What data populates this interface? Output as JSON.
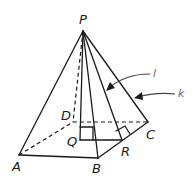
{
  "diagram": {
    "type": "square pyramid",
    "vertices": {
      "P": {
        "label": "P",
        "x": 83,
        "y": 31,
        "label_x": 79,
        "label_y": 24
      },
      "A": {
        "label": "A",
        "x": 19,
        "y": 155,
        "label_x": 12,
        "label_y": 171
      },
      "B": {
        "label": "B",
        "x": 98,
        "y": 158,
        "label_x": 92,
        "label_y": 173
      },
      "C": {
        "label": "C",
        "x": 148,
        "y": 122,
        "label_x": 146,
        "label_y": 139
      },
      "D": {
        "label": "D",
        "x": 73,
        "y": 122,
        "label_x": 61,
        "label_y": 120
      },
      "Q": {
        "label": "Q",
        "x": 80,
        "y": 140,
        "label_x": 67,
        "label_y": 146
      },
      "R": {
        "label": "R",
        "x": 122,
        "y": 140,
        "label_x": 121,
        "label_y": 156
      }
    },
    "lines": {
      "l": {
        "label": "l",
        "label_x": 153,
        "label_y": 77
      },
      "k": {
        "label": "k",
        "label_x": 178,
        "label_y": 97
      }
    },
    "colors": {
      "stroke": "#1a1a1a",
      "arrow": "#444444",
      "background": "#ffffff"
    }
  }
}
